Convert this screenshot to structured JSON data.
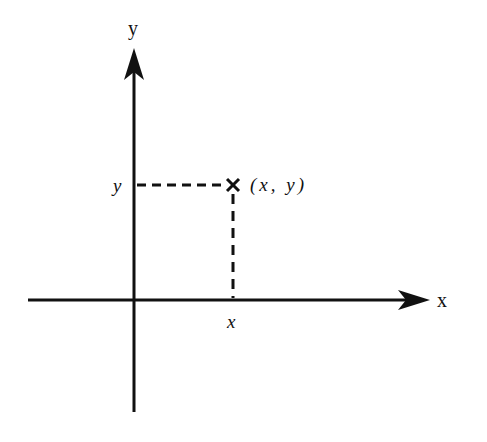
{
  "diagram": {
    "type": "cartesian-point",
    "axes": {
      "x_label": "x",
      "y_label": "y"
    },
    "point": {
      "label": "(x, y)",
      "x_tick_label": "x",
      "y_tick_label": "y",
      "marker": "cross"
    },
    "colors": {
      "ink": "#111111",
      "background": "#ffffff"
    }
  }
}
